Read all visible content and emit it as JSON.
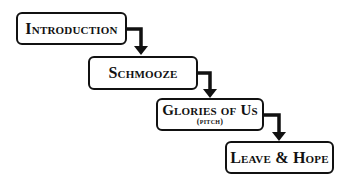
{
  "diagram": {
    "type": "staircase-flow",
    "steps": [
      {
        "label": "Introduction",
        "sub": ""
      },
      {
        "label": "Schmooze",
        "sub": ""
      },
      {
        "label": "Glories of Us",
        "sub": "(pitch)"
      },
      {
        "label": "Leave & Hope",
        "sub": ""
      }
    ],
    "connectors": [
      {
        "from": 0,
        "to": 1,
        "style": "elbow-arrow"
      },
      {
        "from": 1,
        "to": 2,
        "style": "elbow-arrow"
      },
      {
        "from": 2,
        "to": 3,
        "style": "elbow-arrow"
      }
    ],
    "colors": {
      "stroke": "#111111",
      "background": "#ffffff"
    }
  }
}
